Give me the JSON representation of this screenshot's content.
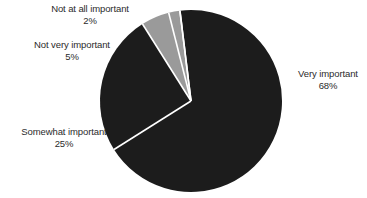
{
  "chart_data": {
    "type": "pie",
    "title": "",
    "subtitle": "",
    "xlabel": "",
    "ylabel": "",
    "legend_position": "none",
    "grid": false,
    "labels_outside": true,
    "start_angle_deg": -7,
    "direction": "clockwise",
    "categories": [
      "Very important",
      "Somewhat important",
      "Not very important",
      "Not at all important"
    ],
    "values": [
      68,
      25,
      5,
      2
    ],
    "value_labels": [
      "68%",
      "25%",
      "5%",
      "2%"
    ],
    "colors": [
      "#1c1c1c",
      "#1c1c1c",
      "#9a9a9a",
      "#9a9a9a"
    ],
    "separator_color": "#ffffff",
    "slices": [
      {
        "name": "Very important",
        "value": 68,
        "value_label": "68%",
        "color": "#1c1c1c"
      },
      {
        "name": "Somewhat important",
        "value": 25,
        "value_label": "25%",
        "color": "#1c1c1c"
      },
      {
        "name": "Not very important",
        "value": 5,
        "value_label": "5%",
        "color": "#9a9a9a"
      },
      {
        "name": "Not at all important",
        "value": 2,
        "value_label": "2%",
        "color": "#9a9a9a"
      }
    ]
  },
  "geometry": {
    "center_x": 191,
    "center_y": 101,
    "radius": 91
  },
  "palette": {
    "background": "#ffffff",
    "dark_slice": "#1c1c1c",
    "light_slice": "#9a9a9a",
    "separator": "#ffffff",
    "label_text": "#2b2b2b"
  }
}
